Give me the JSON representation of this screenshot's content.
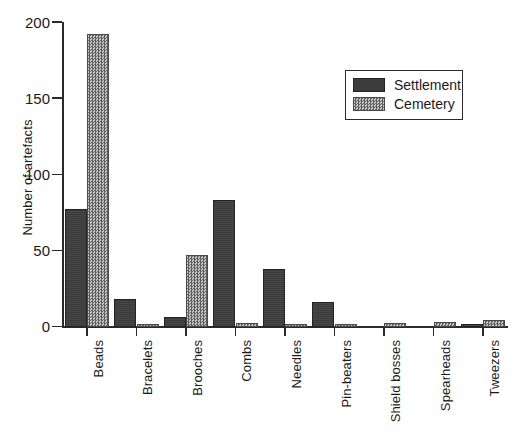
{
  "chart_data": {
    "type": "bar",
    "title": "",
    "xlabel": "",
    "ylabel": "Number of artefacts",
    "ylim": [
      0,
      200
    ],
    "yticks": [
      0,
      50,
      100,
      150,
      200
    ],
    "grid": false,
    "legend_position": "upper-right",
    "orientation": "vertical",
    "grouping": "grouped",
    "categories": [
      "Beads",
      "Bracelets",
      "Brooches",
      "Combs",
      "Needles",
      "Pin-beaters",
      "Shield bosses",
      "Spearheads",
      "Tweezers"
    ],
    "series": [
      {
        "name": "Settlement",
        "color": "#3b3b3b",
        "fill": "solid-dark",
        "values": [
          77,
          18,
          6,
          83,
          38,
          16,
          0,
          0,
          1
        ]
      },
      {
        "name": "Cemetery",
        "color": "#8e8e8e",
        "fill": "checkerboard-gray",
        "values": [
          192,
          1,
          47,
          2,
          1,
          1,
          2,
          3,
          4
        ]
      }
    ]
  },
  "axes": {
    "y_title": "Number of artefacts",
    "y_tick_labels": [
      "0",
      "50",
      "100",
      "150",
      "200"
    ]
  },
  "legend": {
    "entries": [
      {
        "label": "Settlement"
      },
      {
        "label": "Cemetery"
      }
    ]
  }
}
